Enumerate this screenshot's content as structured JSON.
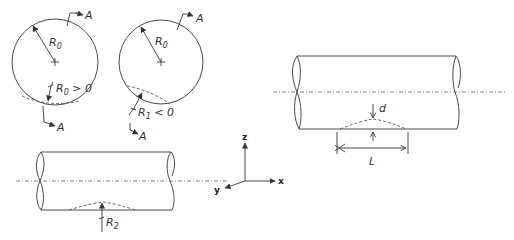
{
  "figure": {
    "circle_positive": {
      "radius_label": "R",
      "radius_sub": "0",
      "condition_label": "R",
      "condition_sub": "0",
      "condition_rel": " > 0",
      "section_top": "A",
      "section_bottom": "A"
    },
    "circle_negative": {
      "radius_label": "R",
      "radius_sub": "0",
      "condition_label": "R",
      "condition_sub": "1",
      "condition_rel": " < 0",
      "section_top": "A",
      "section_bottom": "A"
    },
    "cylinder_bottom": {
      "radius_label": "R",
      "radius_sub": "2"
    },
    "axes": {
      "z": "z",
      "x": "x",
      "y": "y"
    },
    "cylinder_right": {
      "depth_label": "d",
      "length_label": "L"
    }
  }
}
